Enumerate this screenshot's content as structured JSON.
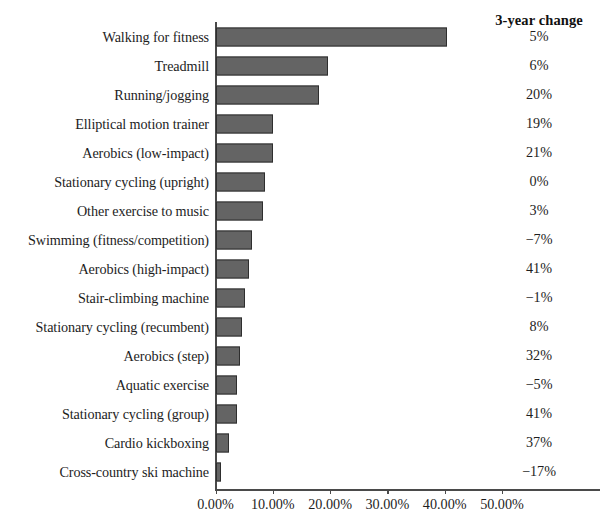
{
  "header": {
    "change_column_title": "3-year change"
  },
  "chart_data": {
    "type": "bar",
    "orientation": "horizontal",
    "title": "",
    "xlabel": "",
    "ylabel": "",
    "xlim": [
      0,
      57
    ],
    "xticks": [
      "0.00%",
      "10.00%",
      "20.00%",
      "30.00%",
      "40.00%",
      "50.00%"
    ],
    "xtick_values": [
      0,
      10,
      20,
      30,
      40,
      50
    ],
    "grid": false,
    "legend": null,
    "bar_color": "#646464",
    "bar_edge_color": "#2e2e2e",
    "categories": [
      "Walking for fitness",
      "Treadmill",
      "Running/jogging",
      "Elliptical motion trainer",
      "Aerobics (low-impact)",
      "Stationary cycling (upright)",
      "Other exercise to music",
      "Swimming (fitness/competition)",
      "Aerobics (high-impact)",
      "Stair-climbing machine",
      "Stationary cycling (recumbent)",
      "Aerobics (step)",
      "Aquatic exercise",
      "Stationary cycling (group)",
      "Cardio kickboxing",
      "Cross-country ski machine"
    ],
    "values": [
      40.4,
      19.5,
      17.9,
      10.0,
      9.9,
      8.5,
      8.2,
      6.3,
      5.7,
      5.0,
      4.6,
      4.2,
      3.7,
      3.7,
      2.2,
      0.8
    ],
    "series": [
      {
        "name": "3-year change",
        "values": [
          "5%",
          "6%",
          "20%",
          "19%",
          "21%",
          "0%",
          "3%",
          "−7%",
          "41%",
          "−1%",
          "8%",
          "32%",
          "−5%",
          "41%",
          "37%",
          "−17%"
        ]
      }
    ]
  }
}
